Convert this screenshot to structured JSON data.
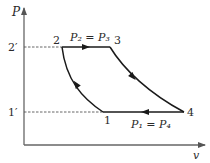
{
  "diagram": {
    "type": "P-v diagram (Brayton cycle)",
    "axes": {
      "y_label": "P",
      "x_label": "v"
    },
    "ticks": {
      "upper": "2′",
      "lower": "1′"
    },
    "points": {
      "p1": "1",
      "p2": "2",
      "p3": "3",
      "p4": "4"
    },
    "equations": {
      "top": "P₂ = P₃",
      "bottom": "P₁ = P₄"
    },
    "processes": [
      {
        "from": "1",
        "to": "2",
        "kind": "compression curve",
        "direction": "1 to 2"
      },
      {
        "from": "2",
        "to": "3",
        "kind": "constant pressure",
        "direction": "2 to 3"
      },
      {
        "from": "3",
        "to": "4",
        "kind": "expansion curve",
        "direction": "3 to 4"
      },
      {
        "from": "4",
        "to": "1",
        "kind": "constant pressure",
        "direction": "4 to 1"
      }
    ],
    "colors": {
      "line": "#1a1a1a",
      "axis": "#555555",
      "dashed": "#555555"
    }
  }
}
